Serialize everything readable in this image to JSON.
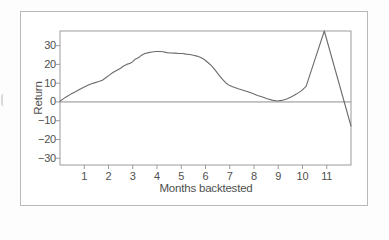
{
  "colors": {
    "page_bg": "#fdfdfd",
    "plot_bg": "#ffffff",
    "frame_border": "#b9b9b9",
    "axis": "#9b9b9b",
    "zero_line": "#8d8d8d",
    "series_line": "#6b6b6b",
    "text": "#4f4f4f"
  },
  "chart_data": {
    "type": "line",
    "title": "",
    "xlabel": "Months backtested",
    "ylabel": "Return",
    "xlim": [
      0,
      12
    ],
    "ylim": [
      -33.6,
      37.8
    ],
    "x_ticks": [
      1,
      2,
      3,
      4,
      5,
      6,
      7,
      8,
      9,
      10,
      11
    ],
    "y_ticks": [
      30,
      20,
      10,
      0,
      -10,
      -20,
      -30
    ],
    "grid": false,
    "legend": "none",
    "zero_line_value": 0,
    "series": [
      {
        "name": "Return",
        "points": [
          [
            0,
            0.4
          ],
          [
            0.15,
            1.8
          ],
          [
            0.3,
            3.0
          ],
          [
            0.45,
            4.2
          ],
          [
            0.6,
            5.2
          ],
          [
            0.8,
            6.6
          ],
          [
            1.0,
            8.0
          ],
          [
            1.15,
            8.9
          ],
          [
            1.3,
            9.7
          ],
          [
            1.45,
            10.3
          ],
          [
            1.6,
            10.9
          ],
          [
            1.75,
            11.6
          ],
          [
            1.9,
            13.0
          ],
          [
            2.05,
            14.4
          ],
          [
            2.2,
            15.8
          ],
          [
            2.35,
            16.9
          ],
          [
            2.5,
            18.0
          ],
          [
            2.6,
            19.0
          ],
          [
            2.75,
            20.0
          ],
          [
            2.9,
            20.6
          ],
          [
            3.0,
            21.5
          ],
          [
            3.1,
            22.8
          ],
          [
            3.25,
            23.6
          ],
          [
            3.35,
            24.8
          ],
          [
            3.5,
            25.8
          ],
          [
            3.65,
            26.3
          ],
          [
            3.8,
            26.6
          ],
          [
            3.95,
            26.9
          ],
          [
            4.1,
            26.9
          ],
          [
            4.25,
            26.7
          ],
          [
            4.4,
            26.3
          ],
          [
            4.55,
            26.1
          ],
          [
            4.75,
            26.0
          ],
          [
            4.9,
            25.8
          ],
          [
            5.05,
            25.8
          ],
          [
            5.2,
            25.5
          ],
          [
            5.35,
            25.3
          ],
          [
            5.5,
            24.9
          ],
          [
            5.65,
            24.4
          ],
          [
            5.8,
            23.6
          ],
          [
            5.95,
            22.6
          ],
          [
            6.1,
            21.0
          ],
          [
            6.25,
            19.2
          ],
          [
            6.4,
            16.9
          ],
          [
            6.55,
            14.4
          ],
          [
            6.7,
            12.0
          ],
          [
            6.85,
            10.0
          ],
          [
            7.0,
            8.7
          ],
          [
            7.15,
            7.9
          ],
          [
            7.35,
            7.0
          ],
          [
            7.55,
            6.2
          ],
          [
            7.75,
            5.4
          ],
          [
            7.95,
            4.5
          ],
          [
            8.15,
            3.5
          ],
          [
            8.35,
            2.6
          ],
          [
            8.55,
            1.7
          ],
          [
            8.75,
            1.0
          ],
          [
            8.95,
            0.5
          ],
          [
            9.15,
            0.8
          ],
          [
            9.35,
            1.6
          ],
          [
            9.55,
            2.8
          ],
          [
            9.75,
            4.2
          ],
          [
            9.95,
            5.9
          ],
          [
            10.15,
            8.3
          ],
          [
            10.9,
            37.8
          ],
          [
            12.0,
            -12.8
          ]
        ]
      }
    ]
  }
}
